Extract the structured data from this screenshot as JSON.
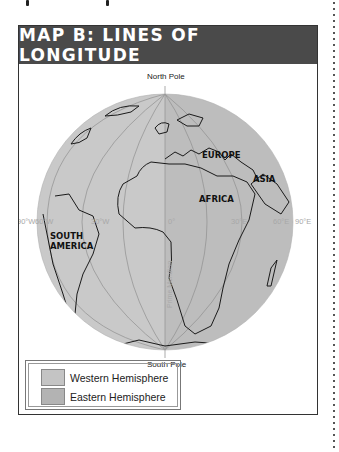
{
  "map": {
    "title": "MAP B: LINES OF LONGITUDE",
    "north_pole_label": "North Pole",
    "south_pole_label": "South Pole",
    "prime_meridian_label": "Prime Meridian",
    "longitude_labels": [
      "90°W",
      "60°W",
      "30°W",
      "0°",
      "30°E",
      "60°E",
      "90°E"
    ],
    "region_labels": {
      "europe": "EUROPE",
      "asia": "ASIA",
      "africa": "AFRICA",
      "south_america_line1": "SOUTH",
      "south_america_line2": "AMERICA"
    },
    "legend": [
      {
        "label": "Western Hemisphere",
        "color": "#c4c4c4"
      },
      {
        "label": "Eastern Hemisphere",
        "color": "#b3b3b3"
      }
    ],
    "colors": {
      "title_bar": "#4a4a4a",
      "globe_west": "#c9c9c9",
      "globe_east": "#bcbcbc",
      "meridian_line": "#8a8a8a",
      "coastline": "#1a1a1a",
      "label_gray": "#a8a8a8"
    }
  }
}
